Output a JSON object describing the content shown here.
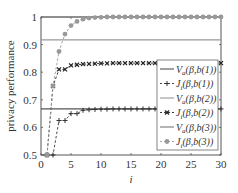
{
  "chart_data": {
    "type": "line",
    "title": "",
    "xlabel": "i",
    "ylabel": "privacy performance",
    "xlim": [
      0,
      30
    ],
    "ylim": [
      0.5,
      1.0
    ],
    "xticks": [
      0,
      5,
      10,
      15,
      20,
      25,
      30
    ],
    "yticks": [
      0.5,
      0.6,
      0.7,
      0.8,
      0.9,
      1
    ],
    "ytick_labels": [
      "0.5",
      "0.6",
      "0.7",
      "0.8",
      "0.9",
      "1"
    ],
    "xtick_labels": [
      "0",
      "5",
      "10",
      "15",
      "20",
      "25",
      "30"
    ],
    "grid": false,
    "legend_position": "lower right (inside)",
    "x": [
      1,
      2,
      3,
      4,
      5,
      6,
      7,
      8,
      9,
      10,
      11,
      12,
      13,
      14,
      15,
      16,
      17,
      18,
      19,
      20,
      21,
      22,
      23,
      24,
      25,
      26,
      27,
      28,
      29,
      30
    ],
    "series": [
      {
        "name": "V_a(β,b(1))",
        "style": "solid",
        "color": "#555555",
        "marker": "none",
        "constant": 0.667
      },
      {
        "name": "J_i(β,b(1))",
        "style": "dashed",
        "color": "#333333",
        "marker": "+",
        "values": [
          0.5,
          0.5,
          0.625,
          0.625,
          0.65,
          0.65,
          0.662,
          0.664,
          0.665,
          0.666,
          0.666,
          0.667,
          0.667,
          0.667,
          0.667,
          0.667,
          0.667,
          0.667,
          0.667,
          0.667,
          0.667,
          0.667,
          0.667,
          0.667,
          0.667,
          0.667,
          0.667,
          0.667,
          0.667,
          0.667
        ]
      },
      {
        "name": "V_a(β,b(2))",
        "style": "solid",
        "color": "#999999",
        "marker": "none",
        "constant": 0.917
      },
      {
        "name": "J_i(β,b(2))",
        "style": "dashed",
        "color": "#222222",
        "marker": "x",
        "values": [
          0.5,
          0.75,
          0.81,
          0.81,
          0.825,
          0.827,
          0.829,
          0.83,
          0.831,
          0.832,
          0.832,
          0.833,
          0.833,
          0.833,
          0.833,
          0.833,
          0.833,
          0.833,
          0.833,
          0.833,
          0.833,
          0.833,
          0.833,
          0.833,
          0.833,
          0.833,
          0.833,
          0.833,
          0.833,
          0.833
        ]
      },
      {
        "name": "V_a(β,b(3))",
        "style": "solid",
        "color": "#777777",
        "marker": "none",
        "constant": 1.0
      },
      {
        "name": "J_i(β,b(3))",
        "style": "dashed",
        "color": "#999999",
        "marker": "*",
        "values": [
          0.5,
          0.75,
          0.875,
          0.938,
          0.969,
          0.984,
          0.992,
          0.996,
          0.998,
          0.999,
          1,
          1,
          1,
          1,
          1,
          1,
          1,
          1,
          1,
          1,
          1,
          1,
          1,
          1,
          1,
          1,
          1,
          1,
          1,
          1
        ]
      }
    ]
  },
  "legend": {
    "items": [
      {
        "base": "V",
        "sub": "a",
        "arg": "(β,b(1))"
      },
      {
        "base": "J",
        "sub": "i",
        "arg": "(β,b(1))"
      },
      {
        "base": "V",
        "sub": "a",
        "arg": "(β,b(2))"
      },
      {
        "base": "J",
        "sub": "i",
        "arg": "(β,b(2))"
      },
      {
        "base": "V",
        "sub": "a",
        "arg": "(β,b(3))"
      },
      {
        "base": "J",
        "sub": "i",
        "arg": "(β,b(3))"
      }
    ]
  }
}
